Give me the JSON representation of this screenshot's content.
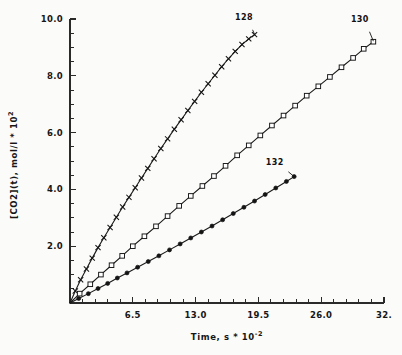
{
  "chart_data": {
    "type": "scatter",
    "title": "",
    "xlabel": "Time, s * 10",
    "xlabel_exponent": "-2",
    "ylabel": "[CO2](t), mol/l * 10",
    "ylabel_exponent": "2",
    "xlim": [
      0,
      32.5
    ],
    "ylim": [
      0,
      10.0
    ],
    "grid": false,
    "legend_position": "inline-end-of-curve",
    "xticks": [
      "6.5",
      "13.0",
      "19.5",
      "26.0",
      "32."
    ],
    "xtick_values": [
      6.5,
      13.0,
      19.5,
      26.0,
      32.5
    ],
    "xminor_count_between": 4,
    "yticks": [
      "2.0",
      "4.0",
      "6.0",
      "8.0",
      "10.0"
    ],
    "ytick_values": [
      2.0,
      4.0,
      6.0,
      8.0,
      10.0
    ],
    "yminor_count_between": 3,
    "series": [
      {
        "name": "128",
        "label": "128",
        "marker": "cross",
        "label_x": 18.0,
        "label_y": 9.95,
        "x": [
          0.0,
          0.55,
          1.1,
          1.7,
          2.3,
          2.9,
          3.5,
          4.15,
          4.8,
          5.45,
          6.1,
          6.75,
          7.4,
          8.05,
          8.7,
          9.4,
          10.1,
          10.8,
          11.5,
          12.2,
          12.9,
          13.6,
          14.3,
          15.0,
          15.7,
          16.4,
          17.1,
          17.8,
          18.5,
          19.1
        ],
        "y": [
          0.0,
          0.42,
          0.82,
          1.2,
          1.58,
          1.95,
          2.3,
          2.66,
          3.02,
          3.38,
          3.72,
          4.06,
          4.4,
          4.74,
          5.08,
          5.44,
          5.78,
          6.12,
          6.45,
          6.78,
          7.1,
          7.42,
          7.72,
          8.02,
          8.32,
          8.6,
          8.86,
          9.1,
          9.3,
          9.45
        ]
      },
      {
        "name": "130",
        "label": "130",
        "marker": "square",
        "label_x": 30.0,
        "label_y": 9.9,
        "x": [
          0.0,
          1.0,
          2.1,
          3.2,
          4.3,
          5.4,
          6.5,
          7.7,
          8.9,
          10.1,
          11.3,
          12.5,
          13.7,
          14.9,
          16.1,
          17.3,
          18.5,
          19.7,
          20.9,
          22.1,
          23.3,
          24.5,
          25.7,
          26.9,
          28.1,
          29.3,
          30.4,
          31.4
        ],
        "y": [
          0.0,
          0.33,
          0.66,
          1.0,
          1.33,
          1.66,
          2.0,
          2.35,
          2.7,
          3.06,
          3.42,
          3.77,
          4.12,
          4.47,
          4.83,
          5.2,
          5.55,
          5.9,
          6.25,
          6.6,
          6.95,
          7.3,
          7.63,
          7.96,
          8.3,
          8.63,
          8.95,
          9.2
        ]
      },
      {
        "name": "132",
        "label": "132",
        "marker": "dot",
        "label_x": 21.2,
        "label_y": 4.85,
        "x": [
          0.0,
          0.9,
          1.9,
          2.9,
          3.9,
          4.9,
          5.9,
          7.0,
          8.1,
          9.2,
          10.3,
          11.4,
          12.5,
          13.6,
          14.7,
          15.8,
          16.9,
          18.0,
          19.1,
          20.2,
          21.3,
          22.4,
          23.2
        ],
        "y": [
          0.0,
          0.16,
          0.33,
          0.51,
          0.69,
          0.88,
          1.06,
          1.26,
          1.46,
          1.66,
          1.87,
          2.08,
          2.29,
          2.5,
          2.71,
          2.93,
          3.15,
          3.37,
          3.59,
          3.82,
          4.05,
          4.28,
          4.45
        ]
      }
    ]
  }
}
